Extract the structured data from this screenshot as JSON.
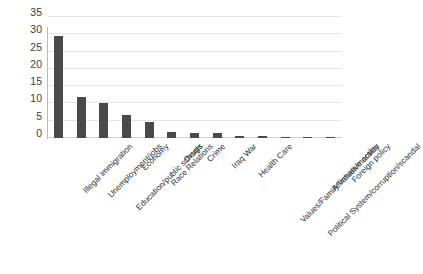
{
  "chart_data": {
    "type": "bar",
    "title": "",
    "xlabel": "",
    "ylabel": "",
    "ylim": [
      0,
      35
    ],
    "yticks": [
      0,
      5,
      10,
      15,
      20,
      25,
      30,
      35
    ],
    "grid": true,
    "legend": false,
    "orientation": "vertical",
    "bar_color": "#4a4a4a",
    "gridline_color": "#e6e6e6",
    "categories": [
      "Illegal immigration",
      "Unemployment/jobs",
      "Education/public schools",
      "Economy",
      "Race Relations",
      "Drugs",
      "Crime",
      "Iraq War",
      "Health Care",
      "Values/Family values/morality",
      "Political System/corruption/scandal",
      "Affirmative action",
      "Foreign policy"
    ],
    "values": [
      29.5,
      12,
      10,
      6.7,
      4.5,
      1.6,
      1.5,
      1.4,
      0.6,
      0.5,
      0.35,
      0.2,
      0.2
    ]
  },
  "axis": {
    "y_tick_labels": [
      "35",
      "30",
      "25",
      "20",
      "15",
      "10",
      "5",
      "0"
    ]
  },
  "title_text": "",
  "caption_text": ""
}
